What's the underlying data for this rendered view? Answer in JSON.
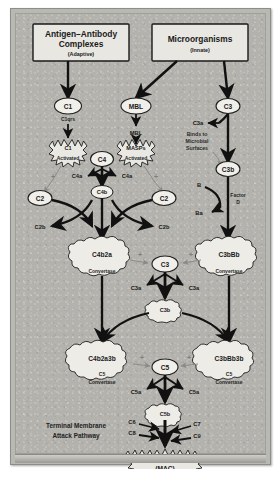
{
  "figure": {
    "background_color": "#b3b2ad",
    "frame_color": "#b9b9b4",
    "ink_color": "#1a1a1a",
    "grey_ink_color": "#8b8a85"
  },
  "sources": {
    "classical": {
      "line1": "Antigen–Antibody",
      "line2": "Complexes",
      "sub": "(Adaptive)"
    },
    "alternative": {
      "line1": "Microorganisms",
      "sub": "(Innate)"
    }
  },
  "nodes": {
    "c1": "C1",
    "c1qrs": "C1qrs",
    "c1_activated_name": "C1",
    "c1_activated_label": "Activated",
    "mbl": "MBL",
    "mbl_label": "MBL",
    "masps": "MASPs",
    "masps_activated_label": "Activated",
    "c4": "C4",
    "c4a_left": "C4a",
    "c4a_right": "C4a",
    "c4b": "C4b",
    "c2_left": "C2",
    "c2_right": "C2",
    "c2b_left": "C2b",
    "c2b_right": "C2b",
    "c3_top": "C3",
    "c3a_top": "C3a",
    "binds_label": "Binds to\nMicrobial\nSurfaces",
    "binds_line1": "Binds to",
    "binds_line2": "Microbial",
    "binds_line3": "Surfaces",
    "c3b_right": "C3b",
    "factor_b": "B",
    "factor_ba": "Ba",
    "factor_d_line1": "Factor",
    "factor_d_line2": "D",
    "c4b2a": "C4b2a",
    "c4b2a_caption": "Convertase",
    "c3bbb": "C3bBb",
    "c3bbb_caption": "Convertase",
    "c3_mid": "C3",
    "c3a_mid_left": "C3a",
    "c3a_mid_right": "C3a",
    "c3b_mid": "C3b",
    "c4b2a3b": "C4b2a3b",
    "c4b2a3b_caption_line1": "C5",
    "c4b2a3b_caption_line2": "Convertase",
    "c3bbb3b": "C3bBb3b",
    "c3bbb3b_caption_line1": "C5",
    "c3bbb3b_caption_line2": "Convertase",
    "c5": "C5",
    "c5a_left": "C5a",
    "c5a_right": "C5a",
    "c5b": "C5b",
    "c6": "C6",
    "c7": "C7",
    "c8": "C8",
    "c9": "C9",
    "terminal_line1": "Terminal Membrane",
    "terminal_line2": "Attack Pathway",
    "mac_line1": "C5b6789",
    "mac_line2": "(MAC)"
  },
  "symbols": {
    "plus": "+",
    "plus_left_mid": "+",
    "plus_right_mid": "+",
    "plus_left_low": "+",
    "plus_right_low": "+",
    "plus_c1": "+",
    "plus_masp": "+"
  }
}
